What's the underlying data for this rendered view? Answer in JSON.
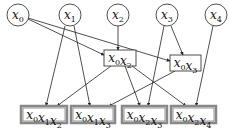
{
  "diagram": {
    "type": "directed-acyclic-graph",
    "colors": {
      "stroke": "#222222",
      "double_border": "#888888",
      "background": "#ffffff"
    },
    "variables": [
      {
        "id": "x0",
        "base": "x",
        "sub": "0",
        "cx": 18,
        "cy": 15
      },
      {
        "id": "x1",
        "base": "x",
        "sub": "1",
        "cx": 70,
        "cy": 15
      },
      {
        "id": "x2",
        "base": "x",
        "sub": "2",
        "cx": 118,
        "cy": 15
      },
      {
        "id": "x3",
        "base": "x",
        "sub": "3",
        "cx": 167,
        "cy": 15
      },
      {
        "id": "x4",
        "base": "x",
        "sub": "4",
        "cx": 216,
        "cy": 15
      }
    ],
    "intermediate": [
      {
        "id": "x0x2",
        "terms": [
          [
            "x",
            "0"
          ],
          [
            "x",
            "2"
          ]
        ],
        "x": 104,
        "y": 50,
        "w": 32,
        "h": 16
      },
      {
        "id": "x0x3",
        "terms": [
          [
            "x",
            "0"
          ],
          [
            "x",
            "3"
          ]
        ],
        "x": 170,
        "y": 55,
        "w": 31,
        "h": 16
      }
    ],
    "outputs": [
      {
        "id": "x0x1x2",
        "terms": [
          [
            "x",
            "0"
          ],
          [
            "x",
            "1"
          ],
          [
            "x",
            "2"
          ]
        ],
        "x": 21,
        "y": 106,
        "w": 46,
        "h": 17
      },
      {
        "id": "x0x1x3",
        "terms": [
          [
            "x",
            "0"
          ],
          [
            "x",
            "1"
          ],
          [
            "x",
            "3"
          ]
        ],
        "x": 71,
        "y": 106,
        "w": 44,
        "h": 17
      },
      {
        "id": "x0x2x3",
        "terms": [
          [
            "x",
            "0"
          ],
          [
            "x",
            "2"
          ],
          [
            "x",
            "3"
          ]
        ],
        "x": 122,
        "y": 106,
        "w": 45,
        "h": 17
      },
      {
        "id": "x0x2x4",
        "terms": [
          [
            "x",
            "0"
          ],
          [
            "x",
            "2"
          ],
          [
            "x",
            "4"
          ]
        ],
        "x": 171,
        "y": 106,
        "w": 45,
        "h": 17
      }
    ],
    "edges": [
      {
        "from": "x0",
        "to": "x0x2",
        "x1": 28,
        "y1": 19,
        "x2": 104,
        "y2": 55
      },
      {
        "from": "x0",
        "to": "x0x3",
        "x1": 28,
        "y1": 18,
        "x2": 170,
        "y2": 61
      },
      {
        "from": "x1",
        "to": "x0x1x2",
        "x1": 65,
        "y1": 26,
        "x2": 46,
        "y2": 106
      },
      {
        "from": "x1",
        "to": "x0x1x3",
        "x1": 74,
        "y1": 26,
        "x2": 90,
        "y2": 106
      },
      {
        "from": "x2",
        "to": "x0x2",
        "x1": 118,
        "y1": 26,
        "x2": 118,
        "y2": 50
      },
      {
        "from": "x3",
        "to": "x0x3",
        "x1": 171,
        "y1": 26,
        "x2": 183,
        "y2": 55
      },
      {
        "from": "x3",
        "to": "x0x2x3",
        "x1": 164,
        "y1": 26,
        "x2": 148,
        "y2": 106
      },
      {
        "from": "x4",
        "to": "x0x2x4",
        "x1": 213,
        "y1": 26,
        "x2": 196,
        "y2": 106
      },
      {
        "from": "x0x2",
        "to": "x0x1x2",
        "x1": 111,
        "y1": 66,
        "x2": 57,
        "y2": 106
      },
      {
        "from": "x0x2",
        "to": "x0x2x3",
        "x1": 125,
        "y1": 66,
        "x2": 140,
        "y2": 106
      },
      {
        "from": "x0x2",
        "to": "x0x2x4",
        "x1": 132,
        "y1": 66,
        "x2": 186,
        "y2": 106
      },
      {
        "from": "x0x3",
        "to": "x0x1x3",
        "x1": 175,
        "y1": 71,
        "x2": 109,
        "y2": 106
      }
    ]
  }
}
